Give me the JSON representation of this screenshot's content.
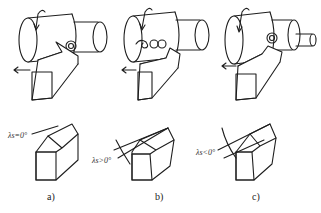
{
  "figure": {
    "panels": [
      {
        "id": "a",
        "caption": "a)",
        "angle_label": "λs=0°",
        "angle_symbol": "λs",
        "relation": "=",
        "value": "0°"
      },
      {
        "id": "b",
        "caption": "b)",
        "angle_label": "λs>0°",
        "angle_symbol": "λs",
        "relation": ">",
        "value": "0°"
      },
      {
        "id": "c",
        "caption": "c)",
        "angle_label": "λs<0°",
        "angle_symbol": "λs",
        "relation": "<",
        "value": "0°"
      }
    ],
    "icons": [
      "workpiece-cylinder",
      "rotation-arrow",
      "chip-curl",
      "cutting-tool",
      "feed-arrow",
      "hatched-section"
    ],
    "colors": {
      "line": "#1e1e1e",
      "background": "#ffffff"
    }
  }
}
